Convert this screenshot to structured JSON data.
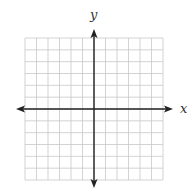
{
  "diagram": {
    "type": "coordinate-plane",
    "grid": {
      "columns": 12,
      "rows": 12,
      "x_min": -6,
      "x_max": 6,
      "y_min": -6,
      "y_max": 6
    },
    "axes": {
      "x_label": "x",
      "y_label": "y"
    },
    "colors": {
      "grid": "#c8c8c8",
      "axis": "#222222",
      "background": "#ffffff"
    }
  }
}
